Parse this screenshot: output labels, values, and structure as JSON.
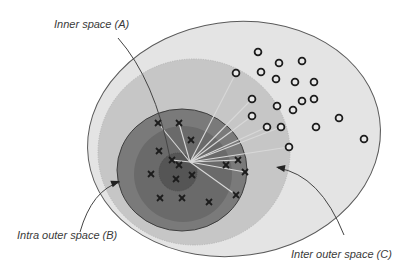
{
  "diagram": {
    "title": "",
    "colors": {
      "background": "#ffffff",
      "outer_space_fill": "#e4e4e4",
      "outer_space_stroke": "#5a5a5a",
      "inter_space_fill": "#c6c6c6",
      "intra_outer_fill": "#7a7a7a",
      "intra_ring_fill": "#6a6a6a",
      "inner_core_fill": "#555555",
      "line_color": "#d8d8d8",
      "marker_color": "#1c1c1c",
      "arrow_color": "#444444"
    },
    "labels": {
      "inner_space": "Inner space (A)",
      "intra_outer_space": "Intra outer space (B)",
      "inter_outer_space": "Inter outer space (C)"
    },
    "center_point": {
      "x": 190,
      "y": 162
    },
    "regions": [
      {
        "id": "outer",
        "cx": 234,
        "cy": 139,
        "rx": 147,
        "ry": 117,
        "rotate": -8
      },
      {
        "id": "inter-outer",
        "cx": 194,
        "cy": 152,
        "rx": 96,
        "ry": 93,
        "rotate": 0
      },
      {
        "id": "intra-outer",
        "cx": 182,
        "cy": 170,
        "rx": 65,
        "ry": 61,
        "rotate": 0
      },
      {
        "id": "intra-ring",
        "cx": 183,
        "cy": 174,
        "rx": 49,
        "ry": 48,
        "rotate": 0
      },
      {
        "id": "inner",
        "cx": 178,
        "cy": 172,
        "rx": 19,
        "ry": 19,
        "rotate": 0
      }
    ],
    "crosses": [
      {
        "x": 158,
        "y": 123
      },
      {
        "x": 179,
        "y": 123
      },
      {
        "x": 191,
        "y": 140
      },
      {
        "x": 159,
        "y": 151
      },
      {
        "x": 172,
        "y": 160
      },
      {
        "x": 179,
        "y": 165
      },
      {
        "x": 151,
        "y": 174
      },
      {
        "x": 176,
        "y": 179
      },
      {
        "x": 192,
        "y": 175
      },
      {
        "x": 226,
        "y": 165
      },
      {
        "x": 238,
        "y": 160
      },
      {
        "x": 245,
        "y": 172
      },
      {
        "x": 160,
        "y": 198
      },
      {
        "x": 182,
        "y": 198
      },
      {
        "x": 209,
        "y": 202
      },
      {
        "x": 236,
        "y": 195
      }
    ],
    "circles": [
      {
        "x": 258,
        "y": 52
      },
      {
        "x": 279,
        "y": 63
      },
      {
        "x": 302,
        "y": 61
      },
      {
        "x": 236,
        "y": 73
      },
      {
        "x": 261,
        "y": 72
      },
      {
        "x": 276,
        "y": 79
      },
      {
        "x": 295,
        "y": 82
      },
      {
        "x": 314,
        "y": 82
      },
      {
        "x": 252,
        "y": 99
      },
      {
        "x": 302,
        "y": 101
      },
      {
        "x": 314,
        "y": 99
      },
      {
        "x": 277,
        "y": 106
      },
      {
        "x": 293,
        "y": 110
      },
      {
        "x": 252,
        "y": 116
      },
      {
        "x": 339,
        "y": 118
      },
      {
        "x": 267,
        "y": 127
      },
      {
        "x": 281,
        "y": 127
      },
      {
        "x": 316,
        "y": 127
      },
      {
        "x": 289,
        "y": 147
      },
      {
        "x": 364,
        "y": 139
      }
    ],
    "spokes_to": [
      {
        "x": 158,
        "y": 123
      },
      {
        "x": 179,
        "y": 123
      },
      {
        "x": 236,
        "y": 73
      },
      {
        "x": 252,
        "y": 99
      },
      {
        "x": 252,
        "y": 116
      },
      {
        "x": 267,
        "y": 127
      },
      {
        "x": 281,
        "y": 127
      },
      {
        "x": 289,
        "y": 147
      },
      {
        "x": 238,
        "y": 160
      },
      {
        "x": 245,
        "y": 172
      },
      {
        "x": 236,
        "y": 195
      },
      {
        "x": 172,
        "y": 160
      }
    ],
    "callouts": [
      {
        "id": "A",
        "path": "M 118 38 Q 155 80 170 158",
        "arrow": false
      },
      {
        "id": "B",
        "path": "M 80 232 Q 92 190 120 182",
        "arrow": true,
        "tip": {
          "x": 120,
          "y": 181
        },
        "angle": -20
      },
      {
        "id": "C",
        "path": "M 344 235 Q 320 175 278 168",
        "arrow": true,
        "tip": {
          "x": 276,
          "y": 167
        },
        "angle": 190
      }
    ]
  }
}
